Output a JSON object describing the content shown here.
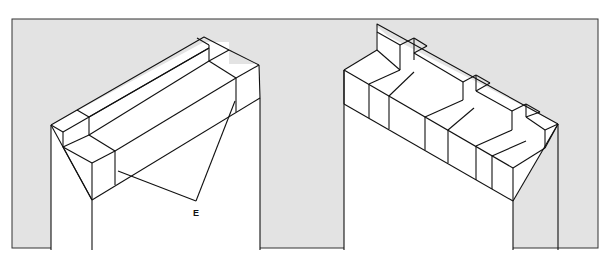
{
  "figure": {
    "background_color": "#e3e3e3",
    "line_color": "#111111",
    "left_drawing": {
      "name": "coping-with-long-blocks",
      "label": "E"
    },
    "right_drawing": {
      "name": "coping-with-short-blocks"
    }
  }
}
